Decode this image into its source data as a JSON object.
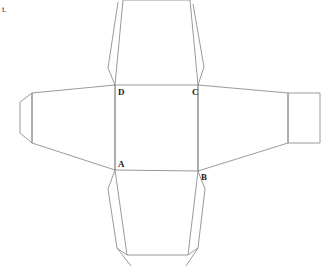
{
  "page": {
    "width": 323,
    "height": 267,
    "background_color": "#ffffff",
    "margin_text": "t."
  },
  "diagram": {
    "stroke_color": "#808080",
    "stroke_width": 0.8,
    "fill": "none",
    "labels": [
      {
        "text": "D",
        "x": 118,
        "y": 95,
        "anchor": "start"
      },
      {
        "text": "C",
        "x": 192,
        "y": 95,
        "anchor": "start"
      },
      {
        "text": "A",
        "x": 118,
        "y": 167,
        "anchor": "start"
      },
      {
        "text": "B",
        "x": 201,
        "y": 180,
        "anchor": "start"
      }
    ],
    "vertices": {
      "A": {
        "x": 115,
        "y": 170
      },
      "B": {
        "x": 198,
        "y": 171
      },
      "C": {
        "x": 198,
        "y": 85
      },
      "D": {
        "x": 115,
        "y": 85
      }
    },
    "shapes": [
      {
        "name": "central-face-ABCD",
        "type": "polygon",
        "points": "115,85 198,85 198,171 115,170"
      },
      {
        "name": "left-panel-trapezoid",
        "type": "polygon",
        "points": "115,85 32,93 32,143 115,170"
      },
      {
        "name": "left-end-flap",
        "type": "polygon",
        "points": "32,93 20,102 20,133 32,143"
      },
      {
        "name": "right-panel-trapezoid",
        "type": "polygon",
        "points": "198,85 288,93 288,143 198,171"
      },
      {
        "name": "right-end-rectangle-flap",
        "type": "polygon",
        "points": "288,93 320,93 320,143 288,143"
      },
      {
        "name": "top-panel-trapezoid",
        "type": "polyline",
        "points": "115,85 123,0 190,0 198,85"
      },
      {
        "name": "top-left-glue-flap",
        "type": "polyline",
        "points": "115,85 108,68 118,2"
      },
      {
        "name": "top-right-glue-flap",
        "type": "polyline",
        "points": "198,85 204,67 193,4"
      },
      {
        "name": "bottom-panel-trapezoid",
        "type": "polyline",
        "points": "115,170 127,255 188,255 198,171"
      },
      {
        "name": "bottom-left-glue-flap",
        "type": "polyline",
        "points": "115,170 108,189 117,248 131,266"
      },
      {
        "name": "bottom-left-flap-base",
        "type": "polyline",
        "points": "117,248 127,255"
      },
      {
        "name": "bottom-right-glue-flap",
        "type": "polyline",
        "points": "198,171 205,189 198,248 186,266"
      },
      {
        "name": "bottom-right-flap-base",
        "type": "polyline",
        "points": "198,248 188,255"
      }
    ]
  }
}
